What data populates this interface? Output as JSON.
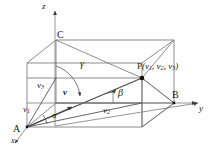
{
  "figure": {
    "type": "3d-vector-direction-angles-diagram",
    "line_color": "#6e6e6e",
    "label_color": "#1a1a1a",
    "background": "#ffffff"
  },
  "axes": {
    "x_label": "x",
    "y_label": "y",
    "z_label": "z"
  },
  "points": {
    "origin_label": "A",
    "y_corner_label": "B",
    "z_corner_label": "C",
    "p_label": "P",
    "p_coords_open": "(",
    "p_c1": "v",
    "p_c1_sub": "1",
    "p_sep1": ", ",
    "p_c2": "v",
    "p_c2_sub": "2",
    "p_sep2": ", ",
    "p_c3": "v",
    "p_c3_sub": "3",
    "p_coords_close": ")"
  },
  "components": {
    "v1_base": "v",
    "v1_sub": "1",
    "v2_base": "v",
    "v2_sub": "2",
    "v3_base": "v",
    "v3_sub": "3"
  },
  "vector": {
    "label": "v"
  },
  "angles": {
    "alpha": "α",
    "beta": "β",
    "gamma": "γ"
  }
}
